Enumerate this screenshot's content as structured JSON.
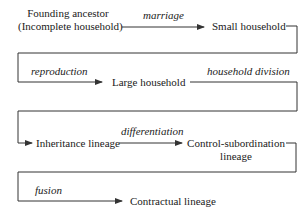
{
  "nodes": {
    "founding": {
      "line1": "Founding ancestor",
      "line2": "(Incomplete household)"
    },
    "small": "Small household",
    "large": "Large household",
    "inheritance": "Inheritance lineage",
    "control": {
      "line1": "Control-subordination",
      "line2": "lineage"
    },
    "contractual": "Contractual lineage"
  },
  "edges": {
    "marriage": "marriage",
    "reproduction": "reproduction",
    "household_division": "household division",
    "differentiation": "differentiation",
    "fusion": "fusion"
  },
  "colors": {
    "line": "#333333",
    "text": "#1a1a1a"
  }
}
